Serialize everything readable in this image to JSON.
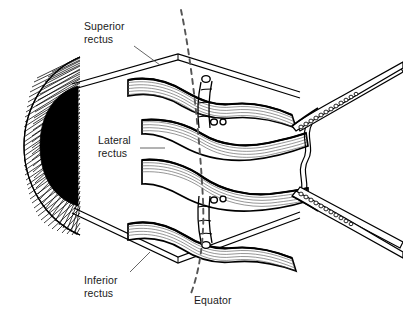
{
  "figure": {
    "background_color": "#ffffff",
    "ink_color": "#000000",
    "text_color": "#1a1a1a",
    "width": 403,
    "height": 319
  },
  "labels": {
    "superior_rectus": "Superior\nrectus",
    "lateral_rectus": "Lateral\nrectus",
    "inferior_rectus": "Inferior\nrectus",
    "equator": "Equator"
  },
  "parts": {
    "globe": "eye-globe",
    "pupil": "pupil",
    "superior_rectus_muscle": "superior-rectus-muscle",
    "lateral_rectus_muscle": "lateral-rectus-muscle",
    "inferior_rectus_muscle": "inferior-rectus-muscle",
    "upper_suture_tie": "upper-suture-tie",
    "lower_suture_tie": "lower-suture-tie",
    "upper_forceps": "upper-forceps",
    "lower_forceps": "lower-forceps",
    "suture_thread": "suture-thread",
    "equator_line": "equator-dashed-line"
  }
}
